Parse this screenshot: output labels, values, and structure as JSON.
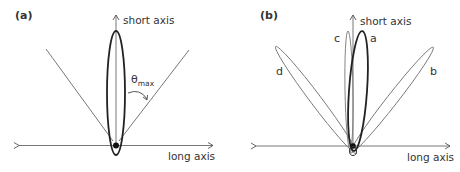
{
  "figure": {
    "panels": [
      {
        "id": "a",
        "label": "(a)",
        "short_axis_label": "short axis",
        "long_axis_label": "long axis",
        "theta_label": "θ",
        "theta_subscript": "max"
      },
      {
        "id": "b",
        "label": "(b)",
        "short_axis_label": "short axis",
        "long_axis_label": "long axis",
        "ellipse_labels": [
          "a",
          "b",
          "c",
          "d"
        ]
      }
    ],
    "colors": {
      "line": "#555555",
      "ellipse_bold": "#222222",
      "ellipse_light": "#777777",
      "dot": "#111111"
    }
  }
}
